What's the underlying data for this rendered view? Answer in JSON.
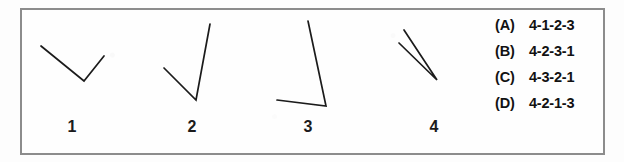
{
  "figure": {
    "name": "line-segment-ordering-question",
    "background_color": "#fdfdfd",
    "frame_color": "#8c8c8c",
    "ink_color": "#1b1b1b"
  },
  "stimuli": [
    {
      "label": "1",
      "name": "shape-1",
      "description": "wide V opening upward",
      "points": "41,46 84,81 104,56",
      "label_x": 60,
      "label_y": 119
    },
    {
      "label": "2",
      "name": "shape-2",
      "description": "narrow V with long right arm",
      "points": "164,68 196,100 210,24",
      "label_x": 180,
      "label_y": 119
    },
    {
      "label": "3",
      "name": "shape-3",
      "description": "acute angle, long arm up-left and short arm left",
      "points": "308,21 326,106 277,100",
      "label_x": 296,
      "label_y": 119
    },
    {
      "label": "4",
      "name": "shape-4",
      "description": "very narrow V, two near-parallel lines converging down-right",
      "points": "404,30 437,80 399,43",
      "label_x": 422,
      "label_y": 119
    }
  ],
  "answer_options": [
    {
      "key": "(A)",
      "value": "4-1-2-3"
    },
    {
      "key": "(B)",
      "value": "4-2-3-1"
    },
    {
      "key": "(C)",
      "value": "4-3-2-1"
    },
    {
      "key": "(D)",
      "value": "4-2-1-3"
    }
  ]
}
